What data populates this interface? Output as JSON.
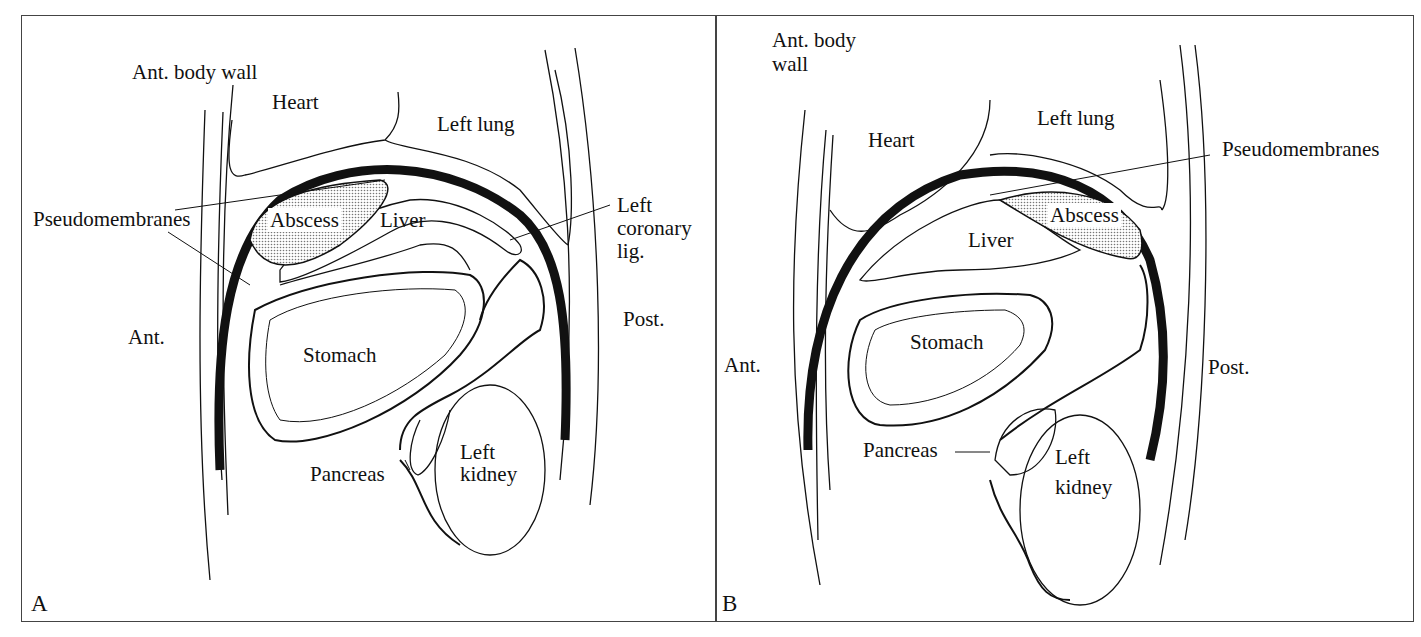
{
  "figure": {
    "panels": [
      {
        "id": "A",
        "panel_label": "A",
        "labels": {
          "ant_body_wall": "Ant. body wall",
          "heart": "Heart",
          "left_lung": "Left lung",
          "pseudomembranes": "Pseudomembranes",
          "abscess": "Abscess",
          "liver": "Liver",
          "left_coronary_lig_1": "Left",
          "left_coronary_lig_2": "coronary",
          "left_coronary_lig_3": "lig.",
          "ant": "Ant.",
          "post": "Post.",
          "stomach": "Stomach",
          "pancreas": "Pancreas",
          "left_kidney_1": "Left",
          "left_kidney_2": "kidney"
        }
      },
      {
        "id": "B",
        "panel_label": "B",
        "labels": {
          "ant_body_wall_1": "Ant. body",
          "ant_body_wall_2": "wall",
          "heart": "Heart",
          "left_lung": "Left lung",
          "pseudomembranes": "Pseudomembranes",
          "abscess": "Abscess",
          "liver": "Liver",
          "ant": "Ant.",
          "post": "Post.",
          "stomach": "Stomach",
          "pancreas": "Pancreas",
          "left_kidney_1": "Left",
          "left_kidney_2": "kidney"
        }
      }
    ]
  }
}
